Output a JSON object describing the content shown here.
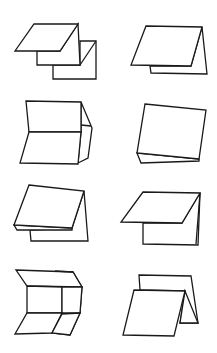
{
  "diagram": {
    "stroke_color": "#1a1a1a",
    "background": "#ffffff",
    "figures": [
      {
        "id": 1,
        "label": "z-fold-three-panel",
        "row": 1,
        "col": 1
      },
      {
        "id": 2,
        "label": "single-fold-tent-offset",
        "row": 1,
        "col": 2
      },
      {
        "id": 3,
        "label": "open-fold-with-side-flap",
        "row": 2,
        "col": 1
      },
      {
        "id": 4,
        "label": "single-fold-tilted",
        "row": 2,
        "col": 2
      },
      {
        "id": 5,
        "label": "double-layer-fold",
        "row": 3,
        "col": 1
      },
      {
        "id": 6,
        "label": "overhang-fold",
        "row": 3,
        "col": 2
      },
      {
        "id": 7,
        "label": "gate-fold-open",
        "row": 4,
        "col": 1
      },
      {
        "id": 8,
        "label": "accordion-tent-fold",
        "row": 4,
        "col": 2
      }
    ]
  }
}
